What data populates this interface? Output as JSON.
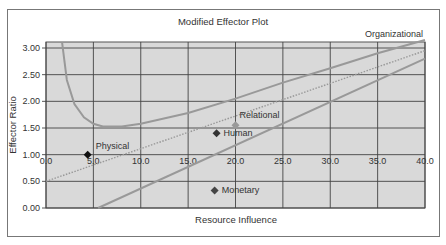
{
  "chart_data": {
    "type": "scatter",
    "title": "Modified Effector Plot",
    "xlabel": "Resource Influence",
    "ylabel": "Effector Ratio",
    "xlim": [
      0,
      40
    ],
    "ylim": [
      0,
      3.1
    ],
    "x_ticks": [
      "0.0",
      "5.0",
      "10.0",
      "15.0",
      "20.0",
      "25.0",
      "30.0",
      "35.0",
      "40.0"
    ],
    "y_ticks": [
      "0.00",
      "0.50",
      "1.00",
      "1.50",
      "2.00",
      "2.50",
      "3.00"
    ],
    "grid": true,
    "points": [
      {
        "label": "Physical",
        "x": 4.4,
        "y": 1.0,
        "color": "#111111"
      },
      {
        "label": "Human",
        "x": 18.0,
        "y": 1.4,
        "color": "#333333"
      },
      {
        "label": "Relational",
        "x": 20.0,
        "y": 1.55,
        "color": "#999999"
      },
      {
        "label": "Monetary",
        "x": 17.8,
        "y": 0.33,
        "color": "#444444"
      }
    ],
    "series": [
      {
        "name": "Organizational",
        "type": "curve",
        "style": "solid",
        "color": "#999999",
        "x": [
          1.7,
          2.2,
          3,
          4,
          5,
          6,
          8,
          10,
          15,
          20,
          25,
          30,
          35,
          40
        ],
        "y": [
          3.1,
          2.4,
          1.95,
          1.7,
          1.58,
          1.53,
          1.53,
          1.58,
          1.78,
          2.05,
          2.35,
          2.62,
          2.9,
          3.15
        ]
      },
      {
        "name": "Upper boundary",
        "type": "line",
        "style": "solid",
        "color": "#999999",
        "x": [
          5.5,
          40
        ],
        "y": [
          0.0,
          2.8
        ]
      },
      {
        "name": "Trend",
        "type": "line",
        "style": "dotted",
        "color": "#999999",
        "x": [
          0,
          40
        ],
        "y": [
          0.5,
          2.95
        ]
      }
    ],
    "annotations": [
      "Organizational",
      "Relational",
      "Human",
      "Physical",
      "Monetary"
    ],
    "plot_background": "#d9d9d9"
  }
}
